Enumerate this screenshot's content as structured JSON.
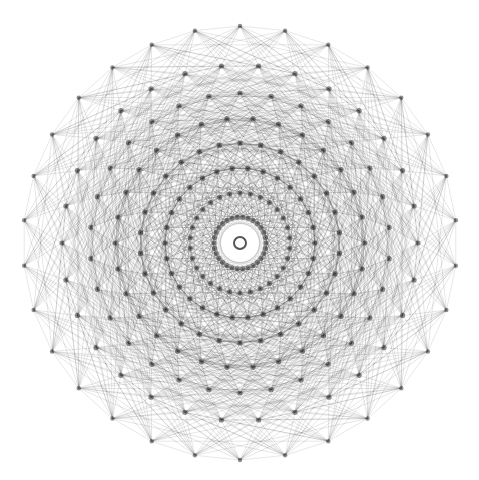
{
  "diagram": {
    "type": "polytope-projection",
    "background": "#ffffff",
    "edge_color": "#000000",
    "vertex_color": "#333333",
    "center_hub_color": "#ffffff",
    "center": [
      240,
      243
    ],
    "symmetry": 30,
    "rings": [
      {
        "radius": 217,
        "phase": 0
      },
      {
        "radius": 178,
        "phase": 0.5
      },
      {
        "radius": 150,
        "phase": 0
      },
      {
        "radius": 125,
        "phase": 0.5
      },
      {
        "radius": 100,
        "phase": 0
      },
      {
        "radius": 75,
        "phase": 0.5
      },
      {
        "radius": 50,
        "phase": 0
      },
      {
        "radius": 26,
        "phase": 0.5
      }
    ]
  }
}
